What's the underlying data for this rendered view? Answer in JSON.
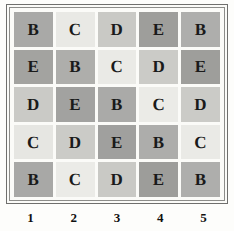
{
  "figure": {
    "type": "latin-square-grid",
    "rows": 5,
    "cols": 5
  },
  "chart_data": {
    "type": "heatmap",
    "title": "",
    "xlabel": "",
    "ylabel": "",
    "grid": false,
    "legend": "none",
    "x_tick_labels": [
      "1",
      "2",
      "3",
      "4",
      "5"
    ],
    "y_tick_labels": [
      "",
      "",
      "",
      "",
      ""
    ],
    "categories": [
      "B",
      "C",
      "D",
      "E"
    ],
    "category_colors": {
      "B": "#a8a8a6",
      "C": "#e6e6e2",
      "D": "#c8c8c4",
      "E": "#9d9d9a"
    },
    "cell_letters": [
      [
        "B",
        "C",
        "D",
        "E",
        "B"
      ],
      [
        "E",
        "B",
        "C",
        "D",
        "E"
      ],
      [
        "D",
        "E",
        "B",
        "C",
        "D"
      ],
      [
        "C",
        "D",
        "E",
        "B",
        "C"
      ],
      [
        "B",
        "C",
        "D",
        "E",
        "B"
      ]
    ],
    "cell_colors": [
      [
        "#a9a9a7",
        "#e9e9e5",
        "#c9c9c5",
        "#9e9e9b",
        "#aeaeac"
      ],
      [
        "#a3a3a0",
        "#aeaeab",
        "#eaeae6",
        "#cbcbc7",
        "#9e9e9b"
      ],
      [
        "#cacac6",
        "#a2a2a0",
        "#aaaaa8",
        "#ebebe7",
        "#cbcbc7"
      ],
      [
        "#e6e6e2",
        "#cbcbc7",
        "#a0a09e",
        "#adadab",
        "#eaeae6"
      ],
      [
        "#a8a8a6",
        "#ebebe7",
        "#c9c9c5",
        "#9d9d9a",
        "#aeaeac"
      ]
    ]
  }
}
